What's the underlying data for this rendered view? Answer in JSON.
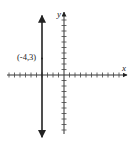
{
  "chart_data": {
    "type": "line",
    "title": "",
    "xlabel": "x",
    "ylabel": "y",
    "xlim": [
      -10,
      11
    ],
    "ylim": [
      -11,
      11
    ],
    "tick_interval": 1,
    "grid": false,
    "series": [
      {
        "name": "vertical line x = -4",
        "equation": "x = -4",
        "x": [
          -4,
          -4
        ],
        "y": [
          -11.3,
          10.8
        ]
      }
    ],
    "points": [
      {
        "x": -4,
        "y": 3,
        "label": "(-4,3)"
      }
    ],
    "annotations": [
      "(-4,3)"
    ]
  }
}
